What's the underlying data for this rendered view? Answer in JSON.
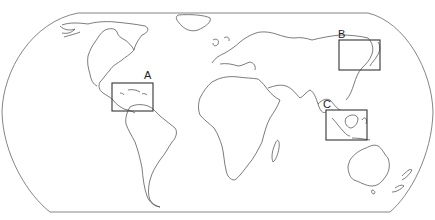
{
  "map": {
    "projection": "equal-earth-like world outline",
    "colors": {
      "background": "#ffffff",
      "coastline": "#444444",
      "frame": "#777777",
      "box": "#333333",
      "label": "#222222"
    },
    "regions": [
      {
        "label": "A",
        "description": "Caribbean / Central America",
        "box": {
          "x": 112,
          "y": 83,
          "w": 41,
          "h": 28
        },
        "label_pos": {
          "x": 144,
          "y": 79
        }
      },
      {
        "label": "B",
        "description": "East Asia (Korea / Japan / eastern China)",
        "box": {
          "x": 339,
          "y": 40,
          "w": 41,
          "h": 30
        },
        "label_pos": {
          "x": 338,
          "y": 38
        }
      },
      {
        "label": "C",
        "description": "Southeast Asia (Malay Peninsula / Sumatra / Borneo)",
        "box": {
          "x": 326,
          "y": 110,
          "w": 41,
          "h": 30
        },
        "label_pos": {
          "x": 323,
          "y": 108
        }
      }
    ]
  }
}
